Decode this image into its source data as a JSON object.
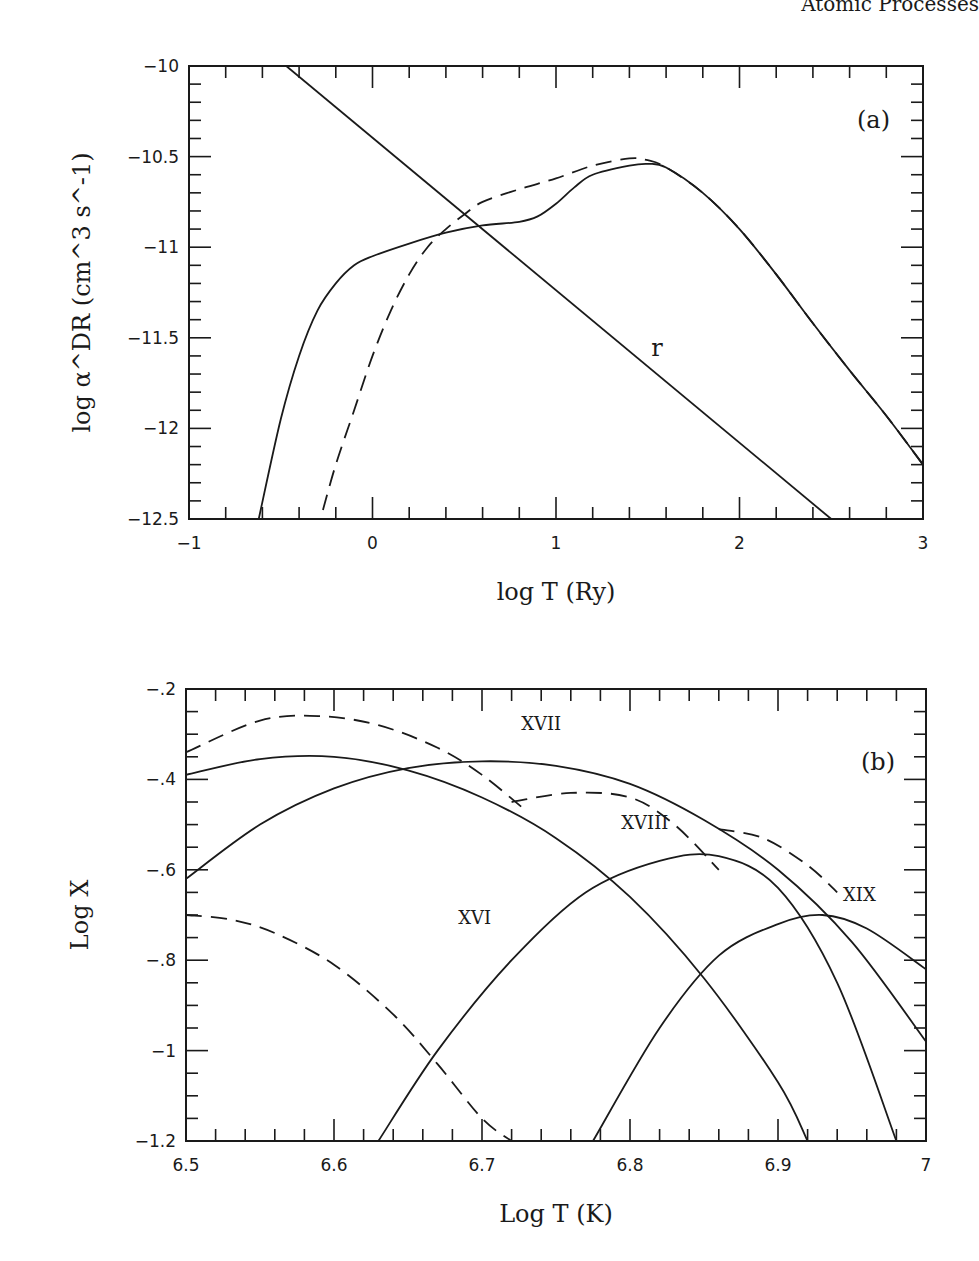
{
  "page": {
    "header_text": "Atomic Processes"
  },
  "chart_data": [
    {
      "panel": "(a)",
      "type": "line",
      "xlabel": "log T (Ry)",
      "ylabel": "log α^DR (cm^3 s^-1)",
      "xlim": [
        -1,
        3
      ],
      "ylim": [
        -12.5,
        -10
      ],
      "xticks": [
        "-1",
        "0",
        "1",
        "2",
        "3"
      ],
      "yticks": [
        "-10",
        "-10.5",
        "-11",
        "-11.5",
        "-12",
        "-12.5"
      ],
      "grid": false,
      "annotations": [
        {
          "text": "r",
          "x": 1.55,
          "y": -11.6
        }
      ],
      "series": [
        {
          "name": "DR (solid)",
          "style": "solid",
          "x": [
            -0.62,
            -0.5,
            -0.4,
            -0.3,
            -0.2,
            -0.1,
            0.0,
            0.2,
            0.4,
            0.6,
            0.8,
            0.9,
            1.0,
            1.1,
            1.2,
            1.4,
            1.5,
            1.6,
            1.8,
            2.0,
            2.2,
            2.4,
            2.6,
            2.8,
            3.0
          ],
          "y": [
            -12.5,
            -11.95,
            -11.6,
            -11.35,
            -11.2,
            -11.1,
            -11.05,
            -10.98,
            -10.92,
            -10.88,
            -10.86,
            -10.83,
            -10.76,
            -10.67,
            -10.6,
            -10.55,
            -10.54,
            -10.56,
            -10.7,
            -10.9,
            -11.15,
            -11.42,
            -11.68,
            -11.93,
            -12.2
          ]
        },
        {
          "name": "DR (dashed)",
          "style": "dashed",
          "x": [
            -0.27,
            -0.2,
            -0.1,
            0.0,
            0.1,
            0.2,
            0.3,
            0.4,
            0.5,
            0.6,
            0.8,
            1.0,
            1.2,
            1.4,
            1.5,
            1.6,
            1.8,
            2.0,
            2.2,
            2.4,
            2.6,
            2.8,
            3.0
          ],
          "y": [
            -12.45,
            -12.2,
            -11.9,
            -11.6,
            -11.35,
            -11.15,
            -11.0,
            -10.9,
            -10.82,
            -10.75,
            -10.68,
            -10.62,
            -10.55,
            -10.51,
            -10.52,
            -10.56,
            -10.7,
            -10.9,
            -11.15,
            -11.42,
            -11.68,
            -11.93,
            -12.2
          ]
        },
        {
          "name": "r",
          "style": "solid",
          "x": [
            -0.47,
            2.5
          ],
          "y": [
            -10.0,
            -12.5
          ]
        }
      ]
    },
    {
      "panel": "(b)",
      "type": "line",
      "xlabel": "Log T (K)",
      "ylabel": "Log X",
      "xlim": [
        6.5,
        7.0
      ],
      "ylim": [
        -1.2,
        -0.2
      ],
      "xticks": [
        "6.5",
        "6.6",
        "6.7",
        "6.8",
        "6.9",
        "7"
      ],
      "yticks": [
        "-.2",
        "-.4",
        "-.6",
        "-.8",
        "-1",
        "-1.2"
      ],
      "grid": false,
      "annotations": [
        {
          "text": "XVI",
          "x": 6.695,
          "y": -0.72
        },
        {
          "text": "XVII",
          "x": 6.74,
          "y": -0.29
        },
        {
          "text": "XVIII",
          "x": 6.81,
          "y": -0.51
        },
        {
          "text": "XIX",
          "x": 6.955,
          "y": -0.67
        }
      ],
      "series": [
        {
          "name": "XVI solid",
          "style": "solid",
          "x": [
            6.5,
            6.55,
            6.6,
            6.65,
            6.7,
            6.75,
            6.8,
            6.85,
            6.9,
            6.92
          ],
          "y": [
            -0.39,
            -0.355,
            -0.35,
            -0.38,
            -0.44,
            -0.53,
            -0.66,
            -0.84,
            -1.07,
            -1.2
          ]
        },
        {
          "name": "XVI dashed",
          "style": "dashed",
          "x": [
            6.5,
            6.53,
            6.56,
            6.6,
            6.64,
            6.67,
            6.7,
            6.72
          ],
          "y": [
            -0.7,
            -0.71,
            -0.74,
            -0.81,
            -0.92,
            -1.03,
            -1.15,
            -1.2
          ]
        },
        {
          "name": "XVII solid",
          "style": "solid",
          "x": [
            6.5,
            6.55,
            6.6,
            6.65,
            6.7,
            6.75,
            6.8,
            6.85,
            6.9,
            6.95,
            7.0
          ],
          "y": [
            -0.62,
            -0.5,
            -0.42,
            -0.375,
            -0.36,
            -0.37,
            -0.41,
            -0.49,
            -0.6,
            -0.76,
            -0.98
          ]
        },
        {
          "name": "XVII dashed",
          "style": "dashed",
          "x": [
            6.5,
            6.55,
            6.59,
            6.63,
            6.67,
            6.7,
            6.73
          ],
          "y": [
            -0.34,
            -0.27,
            -0.26,
            -0.28,
            -0.33,
            -0.39,
            -0.47
          ]
        },
        {
          "name": "XVIII solid",
          "style": "solid",
          "x": [
            6.63,
            6.67,
            6.72,
            6.77,
            6.82,
            6.86,
            6.9,
            6.94,
            6.98
          ],
          "y": [
            -1.2,
            -1.0,
            -0.8,
            -0.65,
            -0.58,
            -0.57,
            -0.64,
            -0.85,
            -1.2
          ]
        },
        {
          "name": "XVIII dashed",
          "style": "dashed",
          "x": [
            6.72,
            6.76,
            6.8,
            6.83,
            6.86
          ],
          "y": [
            -0.45,
            -0.43,
            -0.44,
            -0.5,
            -0.6
          ]
        },
        {
          "name": "XIX solid",
          "style": "solid",
          "x": [
            6.775,
            6.82,
            6.86,
            6.9,
            6.93,
            6.96,
            7.0
          ],
          "y": [
            -1.2,
            -0.95,
            -0.79,
            -0.72,
            -0.7,
            -0.73,
            -0.82
          ]
        },
        {
          "name": "XIX dashed",
          "style": "dashed",
          "x": [
            6.86,
            6.89,
            6.92,
            6.94
          ],
          "y": [
            -0.51,
            -0.53,
            -0.59,
            -0.65
          ]
        }
      ]
    }
  ]
}
